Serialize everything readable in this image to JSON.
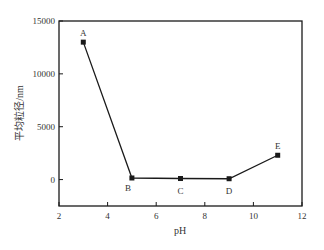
{
  "chart_data": {
    "type": "line",
    "title": "",
    "xlabel": "pH",
    "ylabel": "平均粒径/nm",
    "xlim": [
      2,
      12
    ],
    "ylim": [
      -2500,
      15000
    ],
    "xticks": [
      2,
      4,
      6,
      8,
      10,
      12
    ],
    "yticks": [
      0,
      5000,
      10000,
      15000
    ],
    "grid": false,
    "legend": null,
    "series": [
      {
        "name": "平均粒径",
        "x": [
          3,
          5,
          7,
          9,
          11
        ],
        "y": [
          13000,
          150,
          100,
          80,
          2300
        ],
        "labels": [
          "A",
          "B",
          "C",
          "D",
          "E"
        ],
        "marker": "square",
        "color": "#1a1a1a"
      }
    ]
  }
}
